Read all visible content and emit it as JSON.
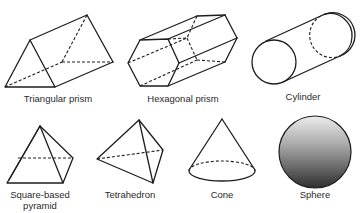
{
  "diagram": {
    "background": "#ffffff",
    "stroke_color": "#1e1e1e",
    "shapes": [
      {
        "id": "triangular-prism",
        "label": "Triangular prism"
      },
      {
        "id": "hexagonal-prism",
        "label": "Hexagonal prism"
      },
      {
        "id": "cylinder",
        "label": "Cylinder"
      },
      {
        "id": "square-based-pyramid",
        "label": "Square-based pyramid"
      },
      {
        "id": "tetrahedron",
        "label": "Tetrahedron"
      },
      {
        "id": "cone",
        "label": "Cone"
      },
      {
        "id": "sphere",
        "label": "Sphere"
      }
    ]
  }
}
